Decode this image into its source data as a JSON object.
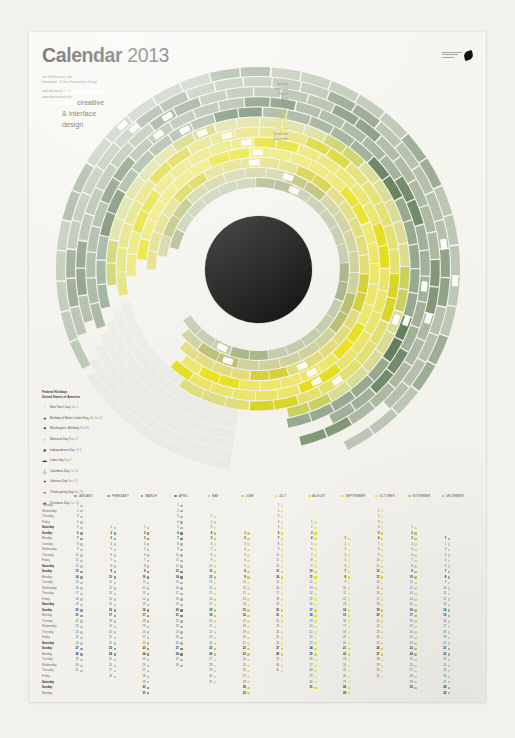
{
  "poster": {
    "title_bold": "Calendar",
    "title_year": "2013",
    "subtitle_lines": [
      "Jan Oberhaeuser, Info",
      "Information  ·  & Data Visualisation Design",
      "",
      "www.oberhaeuser.info",
      "www.oberhaeuser.info"
    ],
    "brand_icon": "bird-logo-icon"
  },
  "hub": {
    "line1": "oberhaeuser",
    "line2": ".info",
    "line2_suffix": "creative",
    "line3": "& interface",
    "line4": "design"
  },
  "wheel": {
    "months_outer_to_inner": [
      "January",
      "February",
      "March",
      "April",
      "May",
      "June",
      "July",
      "August",
      "September",
      "October",
      "November",
      "December"
    ],
    "colors": {
      "january": "#9aab92",
      "february": "#8f9f86",
      "march": "#7f9475",
      "april": "#6d8765",
      "may": "#5e7c57",
      "june": "#c9cf5a",
      "july": "#d8d520",
      "august": "#e3dd18",
      "september": "#e8e11a",
      "october": "#d6cf33",
      "november": "#b9bd6a",
      "december": "#a8b488"
    },
    "week_marker_label": "W",
    "gap_start_oclock": "10"
  },
  "legend": {
    "title_line1": "Federal Holidays",
    "title_line2": "United States of America",
    "items": [
      {
        "icon": "tree-icon",
        "label": "New Year's Day",
        "note": "Jan 1"
      },
      {
        "icon": "star-icon",
        "label": "Birthday of Martin Luther King, Jr.",
        "note": "Jan 21"
      },
      {
        "icon": "flag-icon",
        "label": "Washington's Birthday",
        "note": "Feb 18"
      },
      {
        "icon": "wreath-icon",
        "label": "Memorial Day",
        "note": "May 27"
      },
      {
        "icon": "firework-icon",
        "label": "Independence Day",
        "note": "Jul 4"
      },
      {
        "icon": "briefcase-icon",
        "label": "Labor Day",
        "note": "Sep 2"
      },
      {
        "icon": "ship-icon",
        "label": "Columbus Day",
        "note": "Oct 14"
      },
      {
        "icon": "medal-icon",
        "label": "Veterans Day",
        "note": "Nov 11"
      },
      {
        "icon": "turkey-icon",
        "label": "Thanksgiving Day",
        "note": "Nov 28"
      },
      {
        "icon": "gift-icon",
        "label": "Christmas Day",
        "note": "Dec 25"
      }
    ]
  },
  "table": {
    "weekday_labels": [
      "Tuesday",
      "Wednesday",
      "Thursday",
      "Friday",
      "Saturday",
      "Sunday",
      "Monday",
      "Tuesday",
      "Wednesday",
      "Thursday",
      "Friday",
      "Saturday",
      "Sunday",
      "Monday",
      "Tuesday",
      "Wednesday",
      "Thursday",
      "Friday",
      "Saturday",
      "Sunday",
      "Monday",
      "Tuesday",
      "Wednesday",
      "Thursday",
      "Friday",
      "Saturday",
      "Sunday",
      "Monday",
      "Tuesday",
      "Wednesday",
      "Thursday",
      "Friday",
      "Saturday",
      "Sunday",
      "Monday"
    ],
    "weekend_rows": [
      4,
      5,
      11,
      12,
      18,
      19,
      25,
      26,
      32,
      33
    ],
    "months": [
      {
        "name": "JANUARY",
        "dot": "#8fa085",
        "start_offset": 0,
        "days": 31
      },
      {
        "name": "FEBRUARY",
        "dot": "#86997c",
        "start_offset": 4,
        "days": 28
      },
      {
        "name": "MARCH",
        "dot": "#7a9070",
        "start_offset": 4,
        "days": 31
      },
      {
        "name": "APRIL",
        "dot": "#6d8765",
        "start_offset": 0,
        "days": 30
      },
      {
        "name": "MAY",
        "dot": "#b9c455",
        "start_offset": 2,
        "days": 31
      },
      {
        "name": "JUNE",
        "dot": "#d2d33e",
        "start_offset": 5,
        "days": 30
      },
      {
        "name": "JULY",
        "dot": "#ded923",
        "start_offset": 0,
        "days": 31
      },
      {
        "name": "AUGUST",
        "dot": "#e6e01a",
        "start_offset": 3,
        "days": 31
      },
      {
        "name": "SEPTEMBER",
        "dot": "#e8e21c",
        "start_offset": 6,
        "days": 30
      },
      {
        "name": "OCTOBER",
        "dot": "#dcd52c",
        "start_offset": 1,
        "days": 31
      },
      {
        "name": "NOVEMBER",
        "dot": "#c0c263",
        "start_offset": 4,
        "days": 30
      },
      {
        "name": "DECEMBER",
        "dot": "#a9b588",
        "start_offset": 6,
        "days": 31
      }
    ],
    "rows_total": 35
  }
}
